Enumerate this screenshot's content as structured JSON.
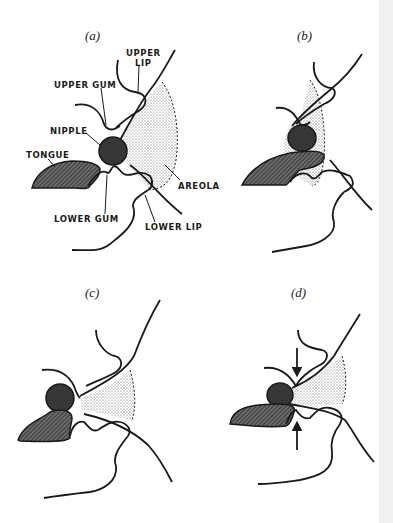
{
  "figure": {
    "panels": [
      {
        "id": "a",
        "label": "(a)"
      },
      {
        "id": "b",
        "label": "(b)"
      },
      {
        "id": "c",
        "label": "(c)"
      },
      {
        "id": "d",
        "label": "(d)"
      }
    ],
    "annotations": {
      "upper_lip_line1": "UPPER",
      "upper_lip_line2": "LIP",
      "upper_gum": "UPPER GUM",
      "nipple": "NIPPLE",
      "tongue": "TONGUE",
      "areola": "AREOLA",
      "lower_gum": "LOWER GUM",
      "lower_lip": "LOWER LIP"
    },
    "colors": {
      "ink": "#1a1a1a",
      "background": "#ffffff",
      "edge_strip": "#f1f1f1"
    }
  }
}
